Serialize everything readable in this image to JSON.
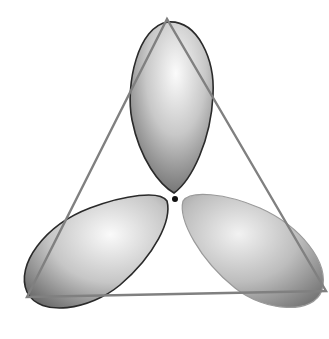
{
  "diagram": {
    "colors": {
      "background": "#ffffff",
      "triangle_stroke": "#808080",
      "lobe_outline": "#2a2a2a",
      "lobe_light": "#f4f4f4",
      "lobe_dark": "#6e6e6e",
      "nucleus": "#111111"
    },
    "nucleus": {
      "cx": 175,
      "cy": 199,
      "r": 3
    },
    "triangle": {
      "points": "167,19 27,297 326,291"
    },
    "lobes": [
      {
        "name": "top-lobe",
        "cx": 171,
        "cy": 110,
        "angle": 0
      },
      {
        "name": "left-lobe",
        "cx": 95,
        "cy": 246,
        "angle": 120
      },
      {
        "name": "right-lobe",
        "cx": 255,
        "cy": 246,
        "angle": 240
      }
    ]
  }
}
